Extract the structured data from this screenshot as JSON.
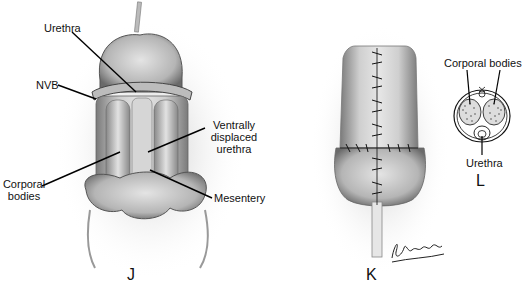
{
  "figure": {
    "panels": [
      {
        "id": "J",
        "letter": "J",
        "labels": {
          "urethra": "Urethra",
          "nvb": "NVB",
          "ventral_line1": "Ventrally",
          "ventral_line2": "displaced",
          "ventral_line3": "urethra",
          "corporal_line1": "Corporal",
          "corporal_line2": "bodies",
          "mesentery": "Mesentery"
        }
      },
      {
        "id": "K",
        "letter": "K",
        "signature": "J. Sellmebs"
      },
      {
        "id": "L",
        "letter": "L",
        "labels": {
          "corporal_bodies": "Corporal bodies",
          "urethra": "Urethra"
        }
      }
    ],
    "colors": {
      "background": "#ffffff",
      "ink": "#111111",
      "tissue_light": "#d8d8d8",
      "tissue_mid": "#a8a8a8",
      "tissue_dark": "#555555"
    }
  }
}
